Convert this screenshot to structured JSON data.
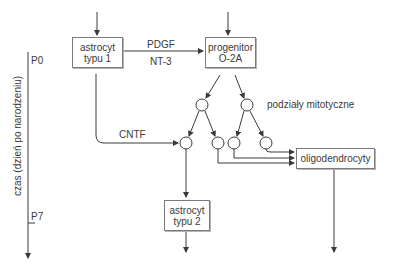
{
  "diagram": {
    "nodes": {
      "astrocyte1": {
        "line1": "astrocyt",
        "line2": "typu 1"
      },
      "progenitor": {
        "line1": "progenitor",
        "line2": "O-2A"
      },
      "oligodendrocytes": {
        "label": "oligodendrocyty"
      },
      "astrocyte2": {
        "line1": "astrocyt",
        "line2": "typu 2"
      }
    },
    "edge_labels": {
      "pdgf": "PDGF",
      "nt3": "NT-3",
      "cntf": "CNTF",
      "mitotic": "podziały mitotyczne"
    },
    "timeline": {
      "axis_label": "czas (dzień po narodzeniu)",
      "start_tick": "P0",
      "end_tick": "P7"
    }
  },
  "colors": {
    "line": "#3a3a3a",
    "box_border": "#7a7a7a",
    "text": "#3a3a3a"
  }
}
